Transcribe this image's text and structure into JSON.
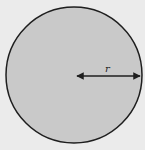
{
  "diagram": {
    "shape": "circle",
    "radius_label": "r",
    "colors": {
      "background": "#ebebeb",
      "fill": "#c9c9c9",
      "stroke": "#1e1e1e"
    }
  }
}
